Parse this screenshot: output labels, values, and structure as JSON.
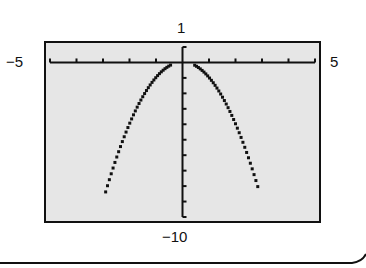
{
  "chart_data": {
    "type": "line",
    "title": "",
    "function": "y = -x^2",
    "xlabel": "",
    "ylabel": "",
    "xlim": [
      -5,
      5
    ],
    "ylim": [
      -10,
      1
    ],
    "xscale": 1,
    "yscale": 1,
    "grid": false,
    "legend": null,
    "series": [
      {
        "name": "left branch",
        "style": "dotted",
        "x": [
          -2.9,
          -2.5,
          -2.0,
          -1.5,
          -1.0,
          -0.5
        ],
        "y": [
          -8.41,
          -6.25,
          -4.0,
          -2.25,
          -1.0,
          -0.25
        ]
      },
      {
        "name": "right branch",
        "style": "dotted",
        "x": [
          0.5,
          1.0,
          1.5,
          2.0,
          2.5,
          2.9
        ],
        "y": [
          -0.25,
          -1.0,
          -2.25,
          -4.0,
          -6.25,
          -8.41
        ]
      }
    ],
    "window_labels": {
      "xmin": "−5",
      "xmax": "5",
      "ymax": "1",
      "ymin": "−10"
    }
  },
  "colors": {
    "screen_bg": "#e6e6e6",
    "ink": "#111111"
  }
}
